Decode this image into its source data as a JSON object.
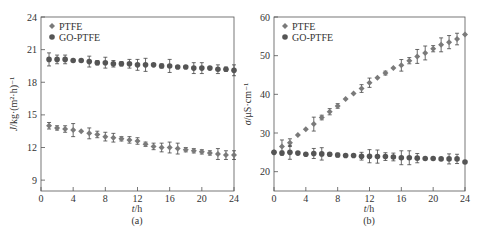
{
  "chart_data": [
    {
      "type": "scatter",
      "panel_label": "(a)",
      "xlabel": "t/h",
      "ylabel": "J/kg·(m²·h)⁻¹",
      "xlim": [
        0,
        24
      ],
      "ylim": [
        8,
        24
      ],
      "xticks": [
        0,
        4,
        8,
        12,
        16,
        20,
        24
      ],
      "yticks": [
        9,
        12,
        15,
        18,
        21,
        24
      ],
      "legend": [
        "PTFE",
        "GO-PTFE"
      ],
      "legend_position": "upper left",
      "grid": false,
      "x": [
        1,
        2,
        3,
        4,
        5,
        6,
        7,
        8,
        9,
        10,
        11,
        12,
        13,
        14,
        15,
        16,
        17,
        18,
        19,
        20,
        21,
        22,
        23,
        24
      ],
      "series": [
        {
          "name": "PTFE",
          "marker": "diamond",
          "values": [
            14.0,
            13.8,
            13.7,
            13.6,
            13.5,
            13.3,
            13.2,
            13.0,
            12.9,
            12.8,
            12.7,
            12.6,
            12.3,
            12.1,
            12.0,
            12.0,
            11.9,
            11.8,
            11.7,
            11.6,
            11.5,
            11.4,
            11.3,
            11.3
          ],
          "errors": [
            0.3,
            0.2,
            0.3,
            0.6,
            0.1,
            0.5,
            0.3,
            0.4,
            0.4,
            0.2,
            0.3,
            0.3,
            0.2,
            0.3,
            0.4,
            0.5,
            0.5,
            0.2,
            0.2,
            0.2,
            0.2,
            0.5,
            0.4,
            0.4
          ]
        },
        {
          "name": "GO-PTFE",
          "marker": "circle",
          "values": [
            20.1,
            20.1,
            20.1,
            20.0,
            20.0,
            19.9,
            19.8,
            19.8,
            19.7,
            19.7,
            19.7,
            19.6,
            19.6,
            19.6,
            19.5,
            19.5,
            19.4,
            19.4,
            19.3,
            19.3,
            19.3,
            19.2,
            19.2,
            19.1
          ],
          "errors": [
            0.6,
            0.4,
            0.4,
            0.1,
            0.1,
            0.5,
            0.2,
            0.5,
            0.3,
            0.2,
            0.4,
            0.5,
            0.6,
            0.1,
            0.2,
            0.6,
            0.1,
            0.1,
            0.5,
            0.5,
            0.1,
            0.4,
            0.2,
            0.5
          ]
        }
      ]
    },
    {
      "type": "scatter",
      "panel_label": "(b)",
      "xlabel": "t/h",
      "ylabel": "σ/μS·cm⁻¹",
      "xlim": [
        0,
        24
      ],
      "ylim": [
        15,
        60
      ],
      "xticks": [
        0,
        4,
        8,
        12,
        16,
        20,
        24
      ],
      "yticks": [
        20,
        30,
        40,
        50,
        60
      ],
      "legend": [
        "PTFE",
        "GO-PTFE"
      ],
      "legend_position": "upper left",
      "grid": false,
      "x": [
        0,
        1,
        2,
        3,
        4,
        5,
        6,
        7,
        8,
        9,
        10,
        11,
        12,
        13,
        14,
        15,
        16,
        17,
        18,
        19,
        20,
        21,
        22,
        23,
        24
      ],
      "series": [
        {
          "name": "PTFE",
          "marker": "diamond",
          "values": [
            25.0,
            26.5,
            27.5,
            29.5,
            31.0,
            32.3,
            34.0,
            35.5,
            37.0,
            38.8,
            40.2,
            41.5,
            43.0,
            44.3,
            45.5,
            46.8,
            47.5,
            48.7,
            49.8,
            50.7,
            51.8,
            52.8,
            53.5,
            54.3,
            55.5
          ],
          "errors": [
            0.3,
            1.7,
            1.0,
            0.3,
            0.3,
            1.8,
            0.6,
            0.8,
            0.6,
            0.3,
            0.3,
            1.0,
            1.2,
            0.3,
            0.5,
            0.3,
            1.5,
            0.8,
            1.8,
            1.8,
            0.8,
            1.8,
            1.7,
            1.5,
            0.2
          ]
        },
        {
          "name": "GO-PTFE",
          "marker": "circle",
          "values": [
            25.0,
            24.8,
            25.0,
            24.8,
            24.5,
            24.7,
            24.6,
            24.5,
            24.3,
            24.2,
            24.2,
            24.0,
            24.0,
            23.9,
            23.9,
            23.8,
            23.6,
            23.6,
            23.5,
            23.4,
            23.4,
            23.3,
            23.3,
            23.3,
            22.5
          ],
          "errors": [
            0.3,
            0.5,
            1.8,
            0.3,
            0.3,
            1.3,
            1.6,
            0.4,
            0.5,
            0.2,
            0.3,
            1.0,
            1.7,
            1.7,
            1.0,
            1.0,
            1.8,
            1.8,
            1.2,
            0.3,
            0.2,
            0.2,
            1.3,
            1.2,
            0.2
          ]
        }
      ]
    }
  ],
  "panels": [
    {
      "label": "(a)",
      "xlabel_italic": "t",
      "xlabel_unit": "/h",
      "ylabel_italic": "J",
      "ylabel_unit": "/kg·(m²·h)⁻¹",
      "legend": [
        "PTFE",
        "GO-PTFE"
      ]
    },
    {
      "label": "(b)",
      "xlabel_italic": "t",
      "xlabel_unit": "/h",
      "ylabel_italic": "σ",
      "ylabel_unit": "/μS·cm⁻¹",
      "legend": [
        "PTFE",
        "GO-PTFE"
      ]
    }
  ],
  "colors": {
    "axis": "#555555",
    "ptfe": "#7a7a7a",
    "go_ptfe": "#555555",
    "text": "#333333"
  }
}
